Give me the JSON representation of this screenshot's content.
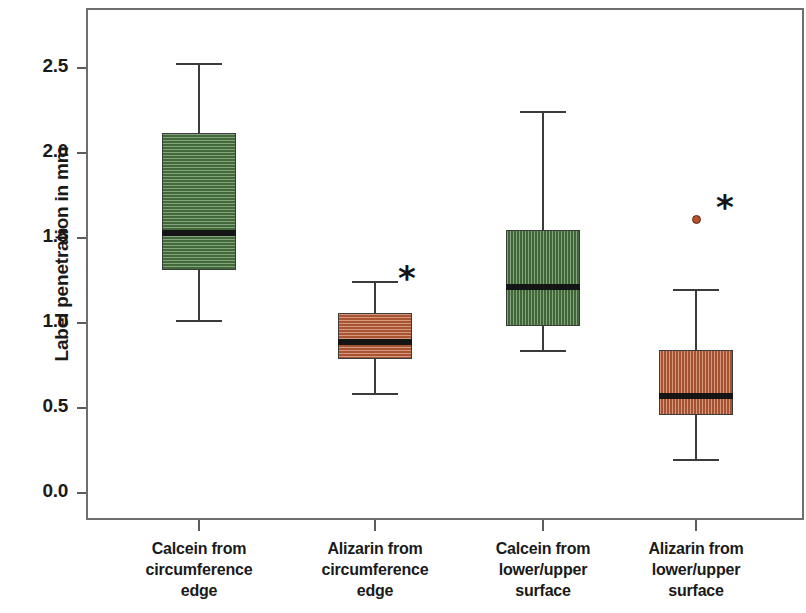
{
  "chart_data": {
    "type": "box",
    "title": "",
    "xlabel": "",
    "ylabel": "Label penetration in mm",
    "ylim": [
      0.0,
      2.75
    ],
    "yticks": [
      "0.0",
      "0.5",
      "1.0",
      "1.5",
      "2.0",
      "2.5"
    ],
    "ytick_values": [
      0.0,
      0.5,
      1.0,
      1.5,
      2.0,
      2.5
    ],
    "grid": false,
    "legend": "none",
    "categories": [
      "Calcein from circumference edge",
      "Alizarin from circumference edge",
      "Calcein from lower/upper surface",
      "Alizarin from lower/upper surface"
    ],
    "category_lines": [
      [
        "Calcein from",
        "circumference",
        "edge"
      ],
      [
        "Alizarin from",
        "circumference",
        "edge"
      ],
      [
        "Calcein from",
        "lower/upper",
        "surface"
      ],
      [
        "Alizarin from",
        "lower/upper",
        "surface"
      ]
    ],
    "colors": {
      "green": "#4e7d44",
      "orange": "#c4633c",
      "outline": "#3b3b3b",
      "median": "#151515",
      "frame": "#6e6e6e",
      "text": "#1a1a1a"
    },
    "boxes": [
      {
        "name": "Calcein from circumference edge",
        "color": "#4e7d44",
        "fill": "green",
        "pattern": "horizontal-stripes",
        "whisker_low": 1.02,
        "q1": 1.31,
        "median": 1.53,
        "q3": 2.12,
        "whisker_high": 2.53,
        "outliers": [],
        "significance_marker": ""
      },
      {
        "name": "Alizarin from circumference edge",
        "color": "#c4633c",
        "fill": "orange",
        "pattern": "horizontal-stripes",
        "whisker_low": 0.59,
        "q1": 0.79,
        "median": 0.89,
        "q3": 1.06,
        "whisker_high": 1.25,
        "outliers": [],
        "significance_marker": "*"
      },
      {
        "name": "Calcein from lower/upper surface",
        "color": "#4e7d44",
        "fill": "green",
        "pattern": "vertical-stripes",
        "whisker_low": 0.84,
        "q1": 0.98,
        "median": 1.21,
        "q3": 1.55,
        "whisker_high": 2.25,
        "outliers": [],
        "significance_marker": ""
      },
      {
        "name": "Alizarin from lower/upper surface",
        "color": "#c4633c",
        "fill": "orange",
        "pattern": "vertical-stripes",
        "whisker_low": 0.2,
        "q1": 0.46,
        "median": 0.57,
        "q3": 0.84,
        "whisker_high": 1.2,
        "outliers": [
          1.61
        ],
        "significance_marker": "*"
      }
    ]
  },
  "axis": {
    "y_title": "Label penetration in mm"
  }
}
